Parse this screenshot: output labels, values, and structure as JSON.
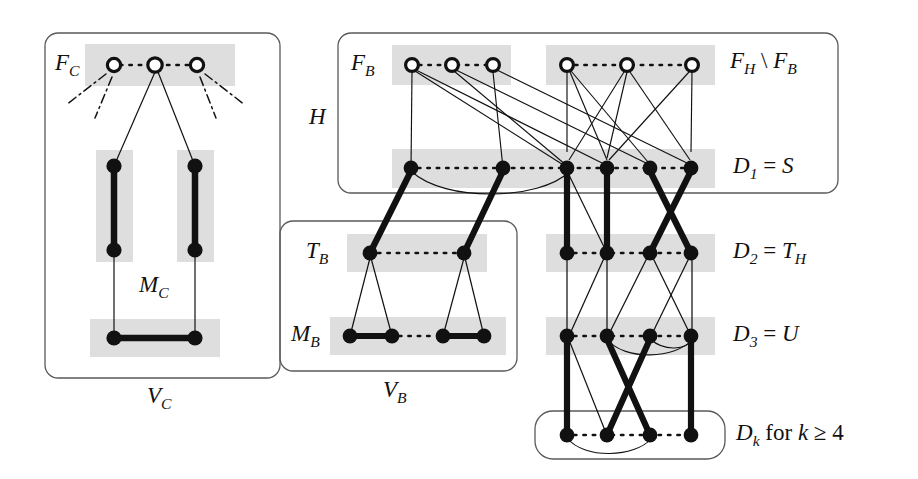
{
  "figure": {
    "kind": "graph-structure-diagram",
    "colors": {
      "ink": "#111111",
      "band": "#dedede",
      "box_stroke": "#555555",
      "node_fill": "#111111",
      "open_node_fill": "#ffffff"
    }
  },
  "labels": {
    "f_c": "F_C",
    "m_c": "M_C",
    "v_c": "V_C",
    "f_b": "F_B",
    "h": "H",
    "f_h_minus_f_b": "F_H \\ F_B",
    "t_b": "T_B",
    "m_b": "M_B",
    "v_b": "V_B",
    "d1": "D_1 = S",
    "d2": "D_2 = T_H",
    "d3": "D_3 = U",
    "dk": "D_k for k ≥ 4"
  },
  "label_parts": {
    "f_c": {
      "base": "F",
      "sub": "C"
    },
    "m_c": {
      "base": "M",
      "sub": "C"
    },
    "v_c": {
      "base": "V",
      "sub": "C"
    },
    "f_b": {
      "base": "F",
      "sub": "B"
    },
    "h": {
      "base": "H",
      "sub": ""
    },
    "t_b": {
      "base": "T",
      "sub": "B"
    },
    "m_b": {
      "base": "M",
      "sub": "B"
    },
    "v_b": {
      "base": "V",
      "sub": "B"
    },
    "fh_fb": {
      "base1": "F",
      "sub1": "H",
      "sep": " \\ ",
      "base2": "F",
      "sub2": "B"
    },
    "d1": {
      "base": "D",
      "sub": "1",
      "eq": " = ",
      "rhs": "S"
    },
    "d2": {
      "base": "D",
      "sub": "2",
      "eq": " = ",
      "rhs": "T",
      "rhs_sub": "H"
    },
    "d3": {
      "base": "D",
      "sub": "3",
      "eq": " = ",
      "rhs": "U"
    },
    "dk": {
      "base": "D",
      "sub": "k",
      "text": " for ",
      "var": "k",
      "rel": " ≥ 4"
    }
  },
  "groups": [
    {
      "name": "V_C",
      "box": [
        45,
        33,
        235,
        345
      ]
    },
    {
      "name": "H",
      "box": [
        338,
        33,
        500,
        160
      ]
    },
    {
      "name": "V_B",
      "box": [
        280,
        221,
        237,
        150
      ]
    },
    {
      "name": "D_k",
      "box": [
        535,
        411,
        190,
        48
      ]
    }
  ],
  "bands": [
    {
      "name": "F_C-band",
      "rect": [
        85,
        44,
        150,
        42
      ]
    },
    {
      "name": "MC-left-band",
      "rect": [
        95,
        150,
        38,
        110
      ]
    },
    {
      "name": "MC-right-band",
      "rect": [
        175,
        150,
        38,
        110
      ]
    },
    {
      "name": "MC-bottom-band",
      "rect": [
        90,
        320,
        128,
        38
      ]
    },
    {
      "name": "F_B-band",
      "rect": [
        392,
        44,
        118,
        40
      ]
    },
    {
      "name": "F_H-band",
      "rect": [
        545,
        44,
        170,
        40
      ]
    },
    {
      "name": "D1-band",
      "rect": [
        392,
        148,
        323,
        40
      ]
    },
    {
      "name": "T_B-band",
      "rect": [
        347,
        234,
        140,
        38
      ]
    },
    {
      "name": "D2-band",
      "rect": [
        545,
        234,
        170,
        38
      ]
    },
    {
      "name": "M_B-band",
      "rect": [
        330,
        317,
        175,
        38
      ]
    },
    {
      "name": "D3-band",
      "rect": [
        545,
        317,
        170,
        38
      ]
    }
  ],
  "rows": {
    "F_C": {
      "y": 65,
      "x": [
        114,
        155,
        197
      ],
      "style": "open"
    },
    "MC_top": {
      "y": 166,
      "x": [
        114,
        195
      ],
      "style": "filled"
    },
    "MC_mid": {
      "y": 250,
      "x": [
        114,
        195
      ],
      "style": "filled"
    },
    "MC_bot": {
      "y": 338,
      "x": [
        114,
        195
      ],
      "style": "filled"
    },
    "F_B": {
      "y": 65,
      "x": [
        412,
        452,
        493
      ],
      "style": "open"
    },
    "F_H": {
      "y": 65,
      "x": [
        567,
        627,
        692
      ],
      "style": "open"
    },
    "D1": {
      "y": 168,
      "x": [
        411,
        503,
        567,
        607,
        650,
        691
      ],
      "style": "filled"
    },
    "T_B": {
      "y": 253,
      "x": [
        370,
        464
      ],
      "style": "filled"
    },
    "D2": {
      "y": 253,
      "x": [
        567,
        607,
        650,
        691
      ],
      "style": "filled"
    },
    "M_B": {
      "y": 336,
      "x": [
        350,
        392,
        443,
        484
      ],
      "style": "filled"
    },
    "D3": {
      "y": 336,
      "x": [
        567,
        607,
        650,
        691
      ],
      "style": "filled"
    },
    "Dk": {
      "y": 435,
      "x": [
        567,
        607,
        650,
        691
      ],
      "style": "filled"
    }
  },
  "counts": {
    "f_c_nodes": 3,
    "f_b_nodes": 3,
    "f_h_minus_f_b_nodes": 3,
    "d1_nodes": 6,
    "d2_nodes": 4,
    "d3_nodes": 4,
    "dk_nodes": 4,
    "t_b_nodes": 2,
    "m_b_nodes": 4
  }
}
